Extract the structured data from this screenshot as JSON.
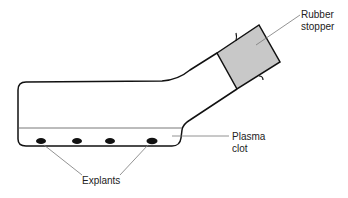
{
  "diagram": {
    "type": "labeled-illustration",
    "colors": {
      "outline": "#111111",
      "stopper_fill": "#c8c8c8",
      "leader_line": "#777777",
      "explant_fill": "#111111"
    },
    "labels": {
      "rubber_stopper_line1": "Rubber",
      "rubber_stopper_line2": "stopper",
      "plasma_clot_line1": "Plasma",
      "plasma_clot_line2": "clot",
      "explants": "Explants"
    },
    "explants": [
      {
        "cx": 41,
        "cy": 141
      },
      {
        "cx": 77,
        "cy": 141
      },
      {
        "cx": 110,
        "cy": 141
      },
      {
        "cx": 152,
        "cy": 141
      }
    ]
  }
}
